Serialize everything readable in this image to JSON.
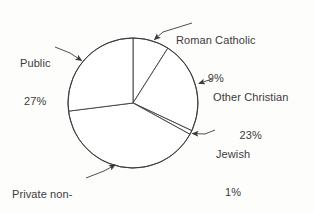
{
  "chart_data": {
    "type": "pie",
    "title": "",
    "subtitle": "",
    "xlabel": "",
    "ylabel": "",
    "legend_position": "callout-labels",
    "grid": false,
    "start_angle_deg": 0,
    "direction": "clockwise",
    "categories": [
      "Roman Catholic",
      "Other Christian",
      "Jewish",
      "Private non-religious",
      "Public"
    ],
    "values": [
      9,
      23,
      1,
      40,
      27
    ],
    "units": "percent",
    "slices": [
      {
        "label": "Roman Catholic",
        "label_lines": [
          "Roman Catholic"
        ],
        "value": 9,
        "value_text": "9%",
        "fill": "#ffffff",
        "stroke": "#3b3b3b"
      },
      {
        "label": "Other Christian",
        "label_lines": [
          "Other Christian"
        ],
        "value": 23,
        "value_text": "23%",
        "fill": "#ffffff",
        "stroke": "#3b3b3b"
      },
      {
        "label": "Jewish",
        "label_lines": [
          "Jewish"
        ],
        "value": 1,
        "value_text": "1%",
        "fill": "#ffffff",
        "stroke": "#3b3b3b"
      },
      {
        "label": "Private non-religious",
        "label_lines": [
          "Private non-",
          "religious"
        ],
        "value": 40,
        "value_text": "40%",
        "fill": "#ffffff",
        "stroke": "#3b3b3b"
      },
      {
        "label": "Public",
        "label_lines": [
          "Public"
        ],
        "value": 27,
        "value_text": "27%",
        "fill": "#ffffff",
        "stroke": "#3b3b3b"
      }
    ]
  },
  "labels": {
    "roman_catholic": {
      "line1": "Roman Catholic",
      "value": "9%"
    },
    "public": {
      "line1": "Public",
      "value": "27%"
    },
    "other_christian": {
      "line1": "Other Christian",
      "value": "23%"
    },
    "jewish": {
      "line1": "Jewish",
      "value": "1%"
    },
    "private_nonreligious": {
      "line1": "Private non-",
      "line2": "religious",
      "value": "40%"
    }
  },
  "style": {
    "background": "#fdfdfc",
    "text_color": "#3b3b3b",
    "line_color": "#3b3b3b",
    "slice_fill": "#ffffff"
  }
}
